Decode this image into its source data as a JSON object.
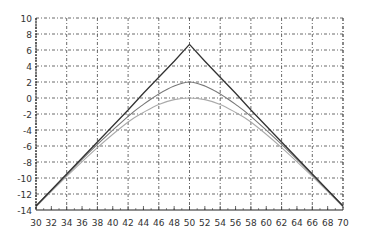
{
  "chart_data": {
    "type": "line",
    "title": "",
    "xlabel": "",
    "ylabel": "",
    "xlim": [
      30,
      70
    ],
    "ylim": [
      -14,
      10
    ],
    "grid": true,
    "legend": null,
    "x_ticks": [
      30,
      32,
      34,
      36,
      38,
      40,
      42,
      44,
      46,
      48,
      50,
      52,
      54,
      56,
      58,
      60,
      62,
      64,
      66,
      68,
      70
    ],
    "y_ticks": [
      10,
      8,
      6,
      4,
      2,
      0,
      -2,
      -4,
      -6,
      -8,
      -10,
      -12,
      -14
    ],
    "x": [
      30,
      34,
      38,
      42,
      44,
      46,
      48,
      50,
      52,
      54,
      56,
      58,
      62,
      66,
      70
    ],
    "series": [
      {
        "name": "triangle",
        "color": "#333333",
        "values": [
          -13.5,
          -9.5,
          -5.5,
          -1.5,
          0.6,
          2.6,
          4.6,
          6.7,
          4.6,
          2.6,
          0.6,
          -1.5,
          -5.5,
          -9.5,
          -13.5
        ]
      },
      {
        "name": "upper-smooth",
        "color": "#777777",
        "values": [
          -13.5,
          -9.6,
          -5.8,
          -2.3,
          -0.8,
          0.5,
          1.5,
          2.0,
          1.5,
          0.5,
          -0.8,
          -2.3,
          -5.8,
          -9.6,
          -13.5
        ]
      },
      {
        "name": "lower-smooth",
        "color": "#aaaaaa",
        "values": [
          -13.6,
          -9.8,
          -6.2,
          -3.0,
          -1.8,
          -0.8,
          -0.2,
          0.0,
          -0.2,
          -0.8,
          -1.8,
          -3.0,
          -6.2,
          -9.8,
          -13.6
        ]
      }
    ]
  }
}
